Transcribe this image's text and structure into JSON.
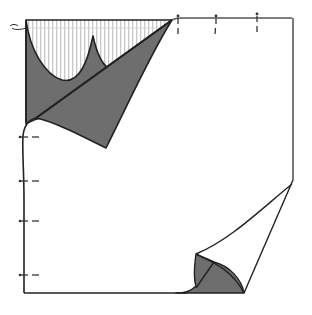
{
  "illustration": {
    "subject": "page-with-curled-corners",
    "alt": "Line drawing of a square sheet of paper with the top-left corner folded down showing a striped underside and the bottom-right corner curling up",
    "colors": {
      "background": "#ffffff",
      "outline": "#222222",
      "fold_fill": "#6e6e6e",
      "stripe": "#c8c8c8",
      "tick": "#333333"
    },
    "top_ticks_x": [
      178,
      216,
      257
    ],
    "left_ticks_y": [
      137,
      181,
      221,
      275
    ]
  }
}
